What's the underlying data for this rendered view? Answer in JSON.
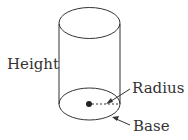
{
  "diagram": {
    "type": "cylinder",
    "labels": {
      "height": "Height",
      "radius": "Radius",
      "base": "Base"
    },
    "colors": {
      "stroke": "#333333",
      "background": "#ffffff"
    }
  }
}
